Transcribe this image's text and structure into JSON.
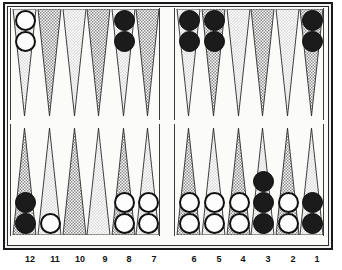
{
  "app": {
    "title": "Backgammon Board",
    "board_type": "backgammon"
  },
  "board": {
    "colors": {
      "frame_border": "#1a1a1a",
      "board_background": "#fbfbfa",
      "point_light": "#d9d9d9",
      "point_dark": "#8a8a8a",
      "checker_white_fill": "#fdfdfd",
      "checker_white_border": "#101010",
      "checker_black_fill": "#1b1b1b",
      "label_color": "#111111"
    },
    "quadrants": {
      "top_left": {
        "name": "top-left-quadrant",
        "points": [
          {
            "shade": "light",
            "checkers": 2,
            "color": "white"
          },
          {
            "shade": "dark",
            "checkers": 0,
            "color": "none"
          },
          {
            "shade": "light",
            "checkers": 0,
            "color": "none"
          },
          {
            "shade": "dark",
            "checkers": 0,
            "color": "none"
          },
          {
            "shade": "light",
            "checkers": 2,
            "color": "black"
          },
          {
            "shade": "dark",
            "checkers": 0,
            "color": "none"
          }
        ]
      },
      "top_right": {
        "name": "top-right-quadrant",
        "points": [
          {
            "shade": "light",
            "checkers": 2,
            "color": "black"
          },
          {
            "shade": "dark",
            "checkers": 2,
            "color": "black"
          },
          {
            "shade": "light",
            "checkers": 0,
            "color": "none"
          },
          {
            "shade": "dark",
            "checkers": 0,
            "color": "none"
          },
          {
            "shade": "light",
            "checkers": 0,
            "color": "none"
          },
          {
            "shade": "dark",
            "checkers": 2,
            "color": "black"
          }
        ]
      },
      "bottom_left": {
        "name": "bottom-left-quadrant",
        "points": [
          {
            "shade": "dark",
            "checkers": 2,
            "color": "black",
            "label": "12"
          },
          {
            "shade": "light",
            "checkers": 1,
            "color": "white",
            "label": "11"
          },
          {
            "shade": "dark",
            "checkers": 0,
            "color": "none",
            "label": "10"
          },
          {
            "shade": "light",
            "checkers": 0,
            "color": "none",
            "label": "9"
          },
          {
            "shade": "dark",
            "checkers": 2,
            "color": "white",
            "label": "8"
          },
          {
            "shade": "light",
            "checkers": 2,
            "color": "white",
            "label": "7"
          }
        ]
      },
      "bottom_right": {
        "name": "bottom-right-quadrant",
        "points": [
          {
            "shade": "dark",
            "checkers": 2,
            "color": "white",
            "label": "6"
          },
          {
            "shade": "light",
            "checkers": 2,
            "color": "white",
            "label": "5"
          },
          {
            "shade": "dark",
            "checkers": 2,
            "color": "white",
            "label": "4"
          },
          {
            "shade": "light",
            "checkers": 3,
            "color": "black",
            "label": "3"
          },
          {
            "shade": "dark",
            "checkers": 2,
            "color": "white",
            "label": "2"
          },
          {
            "shade": "light",
            "checkers": 2,
            "color": "black",
            "label": "1"
          }
        ]
      }
    },
    "bar": {
      "name": "center-bar",
      "checkers_white": 0,
      "checkers_black": 0
    },
    "labels": [
      {
        "text": "12",
        "x": 19
      },
      {
        "text": "11",
        "x": 44
      },
      {
        "text": "10",
        "x": 69
      },
      {
        "text": "9",
        "x": 94
      },
      {
        "text": "8",
        "x": 118
      },
      {
        "text": "7",
        "x": 143
      },
      {
        "text": "6",
        "x": 183
      },
      {
        "text": "5",
        "x": 208
      },
      {
        "text": "4",
        "x": 232
      },
      {
        "text": "3",
        "x": 257
      },
      {
        "text": "2",
        "x": 282
      },
      {
        "text": "1",
        "x": 306
      }
    ]
  }
}
